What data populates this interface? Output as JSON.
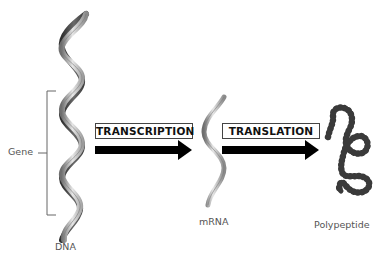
{
  "diagram": {
    "title": "",
    "stages": [
      {
        "id": "dna",
        "label": "DNA"
      },
      {
        "id": "mrna",
        "label": "mRNA"
      },
      {
        "id": "polypeptide",
        "label": "Polypeptide"
      }
    ],
    "processes": [
      {
        "id": "transcription",
        "label": "TRANSCRIPTION",
        "from": "DNA",
        "to": "mRNA"
      },
      {
        "id": "translation",
        "label": "TRANSLATION",
        "from": "mRNA",
        "to": "Polypeptide"
      }
    ],
    "annotations": {
      "gene_bracket_label": "Gene"
    },
    "colors": {
      "arrow": "#000000",
      "strand_light": "#d9d9d9",
      "strand_mid": "#9a9a9a",
      "strand_dark": "#4a4a4a",
      "bead": "#3a3a3a",
      "label_text": "#555555",
      "bracket": "#666666"
    }
  }
}
